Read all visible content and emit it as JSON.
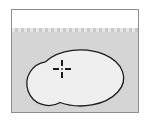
{
  "figure": {
    "title": "Selection region illustration",
    "caption": "",
    "background_color": "#ffffff"
  },
  "frame": {
    "name": "canvas-frame",
    "border_color": "#8e8e8e",
    "border_width_px": 1,
    "x": 11,
    "y": 9,
    "width": 128,
    "height": 104
  },
  "canvas": {
    "white_band": {
      "label": "white margin band",
      "color": "#ffffff",
      "height_px": 18
    },
    "image_area": {
      "label": "image area",
      "color": "#d5d5d5"
    },
    "top_edge": {
      "label": "serrated top edge",
      "light_color": "#e6e6e6",
      "dark_color": "#c9c9c9",
      "tooth_width_px": 3
    }
  },
  "selection": {
    "label": "selection outline",
    "fill_color": "#efefef",
    "stroke_color": "#1c1c1c",
    "stroke_width": 1.3,
    "parts": [
      {
        "name": "large-ellipse",
        "shape": "ellipse",
        "cx": 76,
        "cy": 43,
        "rx": 43,
        "ry": 28
      },
      {
        "name": "small-circle",
        "shape": "circle",
        "cx": 31,
        "cy": 55,
        "r": 22
      }
    ],
    "path": "M 33.5 33.8 A 22 22 0 1 0 48.0 74.5 A 43 28 0 1 0 33.5 33.8 Z"
  },
  "crosshair": {
    "label": "crosshair marker",
    "color": "#1c1c1c",
    "center_color": "#6a6a6a",
    "x": 60,
    "y": 59,
    "size_px": 18,
    "arm_length_px": 6,
    "gap_px": 2,
    "arms": [
      "left",
      "right",
      "top",
      "bottom"
    ]
  }
}
